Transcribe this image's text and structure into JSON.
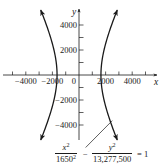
{
  "chart_data": {
    "type": "line",
    "title": "",
    "xlabel": "x",
    "ylabel": "y",
    "xlim": [
      -5800,
      5800
    ],
    "ylim": [
      -5200,
      5200
    ],
    "grid": false,
    "x_ticks": [
      -5000,
      -4000,
      -3000,
      -2000,
      -1000,
      1000,
      2000,
      3000,
      4000,
      5000
    ],
    "x_tick_labels": [
      {
        "value": -4000,
        "label": "−4000"
      },
      {
        "value": -2000,
        "label": "−2000"
      },
      {
        "value": 0,
        "label": "0"
      },
      {
        "value": 2000,
        "label": "2000"
      },
      {
        "value": 4000,
        "label": "4000"
      }
    ],
    "y_ticks": [
      -4000,
      -3000,
      -2000,
      -1000,
      1000,
      2000,
      3000,
      4000
    ],
    "y_tick_labels": [
      {
        "value": 4000,
        "label": "4000"
      },
      {
        "value": 2000,
        "label": "2000"
      },
      {
        "value": -2000,
        "label": "−2000"
      },
      {
        "value": -4000,
        "label": "−4000"
      }
    ],
    "curve": {
      "kind": "hyperbola",
      "a": 1650,
      "b_squared": 13277500,
      "y_range": [
        -5200,
        5200
      ],
      "branches": [
        "left",
        "right"
      ],
      "arrows_at_ends": true
    },
    "annotation": {
      "equation_numerator_x": "x",
      "equation_denominator_x_base": "1650",
      "equation_numerator_y": "y",
      "equation_denominator_y": "13,277,500",
      "minus": "−",
      "equals": "= 1",
      "pointer_from": [
        500,
        -5800
      ],
      "pointer_to": [
        2500,
        -3650
      ]
    },
    "layout": {
      "origin_px": [
        79,
        75
      ],
      "px_per_unit_x": 0.0133,
      "px_per_unit_y": 0.0125,
      "x_axis_px": [
        3,
        157
      ],
      "y_axis_px": [
        9,
        140
      ],
      "line_color": "#1a1a1a"
    }
  },
  "equation": {
    "x_num": "x",
    "x_den": "1650",
    "y_num": "y",
    "y_den": "13,277,500",
    "sq": "2",
    "minus": "−",
    "equals": "= 1"
  }
}
